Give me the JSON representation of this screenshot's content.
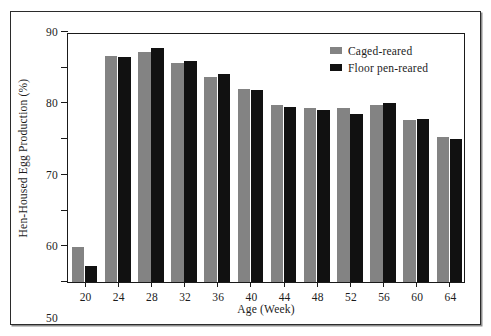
{
  "chart_data": {
    "type": "bar",
    "title": "",
    "xlabel": "Age (Week)",
    "ylabel": "Hen-Housed Egg Production (%)",
    "categories": [
      20,
      24,
      28,
      32,
      36,
      40,
      44,
      48,
      52,
      56,
      60,
      64
    ],
    "category_labels": [
      "20",
      "24",
      "28",
      "32",
      "36",
      "40",
      "44",
      "48",
      "52",
      "56",
      "60",
      "64"
    ],
    "series": [
      {
        "name": "Caged-reared",
        "color": "#838383",
        "values": [
          29.8,
          83.4,
          84.5,
          81.4,
          77.5,
          74.0,
          69.6,
          68.7,
          68.8,
          69.6,
          65.5,
          60.5
        ]
      },
      {
        "name": "Floor pen-reared",
        "color": "#111111",
        "values": [
          24.4,
          82.9,
          85.6,
          82.0,
          78.2,
          73.9,
          68.9,
          68.2,
          67.0,
          70.2,
          65.6,
          60.0
        ]
      }
    ],
    "ylim": [
      20,
      90
    ],
    "yticks": [
      20,
      30,
      40,
      50,
      60,
      70,
      80,
      90
    ],
    "ytick_labels": [
      "20",
      "30",
      "40",
      "50",
      "60",
      "70",
      "80",
      "90"
    ],
    "grid": false,
    "legend_position": "top-right"
  },
  "legend": {
    "entries": [
      {
        "label": "Caged-reared",
        "swatch": "caged"
      },
      {
        "label": "Floor pen-reared",
        "swatch": "floor"
      }
    ]
  }
}
